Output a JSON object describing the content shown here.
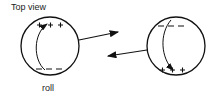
{
  "labels": {
    "title": "Top view",
    "caption": "roll"
  },
  "diagram": {
    "left_sphere": {
      "top_charges": "+ + + +",
      "bottom_charges": "- - -",
      "arrow_direction": "right"
    },
    "right_sphere": {
      "top_charges": "- - -",
      "bottom_charges": "+ + + +",
      "arrow_direction": "left"
    },
    "colors": {
      "stroke": "#111111",
      "background": "#ffffff"
    }
  }
}
